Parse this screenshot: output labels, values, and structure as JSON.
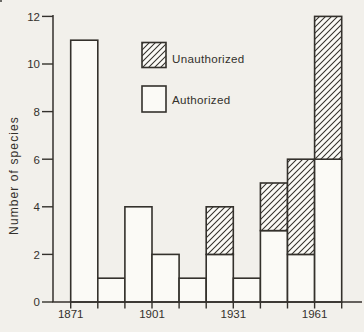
{
  "figure": {
    "background": "#f2f0eb",
    "ink": "#34312c",
    "bar_fill": "#fbfaf6"
  },
  "chart_data": {
    "type": "bar",
    "stacked": true,
    "title": "",
    "xlabel": "",
    "ylabel": "Number of species",
    "ylim": [
      0,
      12
    ],
    "yticks": [
      0,
      2,
      4,
      6,
      8,
      10,
      12
    ],
    "grid": false,
    "categories": [
      "1871-81",
      "1881-91",
      "1891-1901",
      "1901-11",
      "1911-21",
      "1921-31",
      "1931-41",
      "1941-51",
      "1951-61",
      "1961-71"
    ],
    "decade_start_years": [
      1871,
      1881,
      1891,
      1901,
      1911,
      1921,
      1931,
      1941,
      1951,
      1961
    ],
    "series": [
      {
        "name": "Authorized",
        "swatch": "open",
        "values": [
          11,
          1,
          4,
          2,
          1,
          2,
          1,
          3,
          2,
          6
        ]
      },
      {
        "name": "Unauthorized",
        "swatch": "hatched",
        "values": [
          0,
          0,
          0,
          0,
          0,
          2,
          0,
          2,
          4,
          6
        ]
      }
    ],
    "axis_tick_years": [
      1871,
      1881,
      1891,
      1901,
      1911,
      1921,
      1931,
      1941,
      1951,
      1961,
      1971
    ],
    "xtick_labels": [
      "1871",
      "1901",
      "1931",
      "1961"
    ],
    "xtick_label_years": [
      1871,
      1901,
      1931,
      1961
    ],
    "legend": {
      "position": "upper-inside-left",
      "entries": [
        {
          "label": "Unauthorized",
          "swatch": "hatched"
        },
        {
          "label": "Authorized",
          "swatch": "open"
        }
      ]
    }
  }
}
